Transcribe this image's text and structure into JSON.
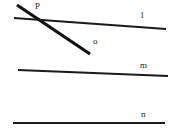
{
  "canvas": {
    "width": 179,
    "height": 132,
    "background": "#ffffff"
  },
  "figure": {
    "stroke_color": "#1a1a1a",
    "labels": {
      "line_l": "l",
      "line_m": "m",
      "line_n": "n",
      "ray_o": "o",
      "point_p": "P"
    },
    "lines": [
      {
        "name": "l",
        "label": "l",
        "style": "thin",
        "x1": 14,
        "y1": 18,
        "x2": 166,
        "y2": 29
      },
      {
        "name": "m",
        "label": "m",
        "style": "thin",
        "x1": 18,
        "y1": 70,
        "x2": 168,
        "y2": 76
      },
      {
        "name": "n",
        "label": "n",
        "style": "thin",
        "x1": 13,
        "y1": 123,
        "x2": 165,
        "y2": 123
      },
      {
        "name": "o",
        "label": "o",
        "style": "thick",
        "x1": 17,
        "y1": 5,
        "x2": 90,
        "y2": 54
      }
    ],
    "points": [
      {
        "name": "P",
        "label": "P",
        "x": 38,
        "y": 19
      }
    ]
  }
}
